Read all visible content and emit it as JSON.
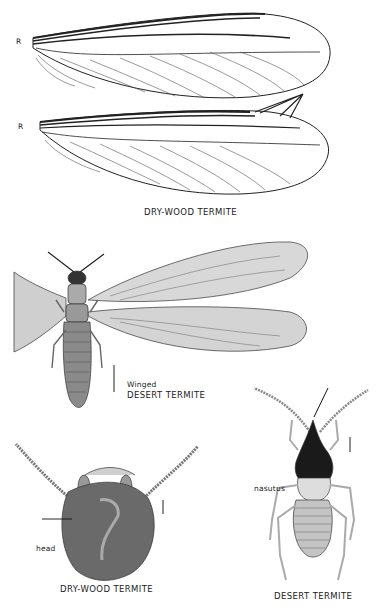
{
  "plate": {
    "sections": [
      {
        "id": "drywood-wings",
        "caption": "DRY-WOOD TERMITE",
        "labels": {
          "forewing_vein": "R",
          "hindwing_vein": "R"
        }
      },
      {
        "id": "winged-desert",
        "caption_line1": "Winged",
        "caption_line2": "DESERT TERMITE",
        "scale_bar": "I"
      },
      {
        "id": "drywood-head",
        "caption": "DRY-WOOD TERMITE",
        "labels": {
          "part": "head"
        },
        "scale_bar": "I"
      },
      {
        "id": "desert-soldier",
        "caption": "DESERT TERMITE",
        "labels": {
          "caste": "nasutus"
        },
        "scale_bar": "I"
      }
    ]
  }
}
